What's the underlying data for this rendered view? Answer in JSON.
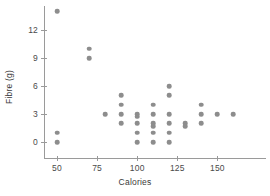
{
  "chart_data": {
    "type": "scatter",
    "title": "",
    "xlabel": "Calories",
    "ylabel": "Fibre (g)",
    "xlim": [
      40,
      170
    ],
    "ylim": [
      -0.6,
      15
    ],
    "grid": false,
    "legend": null,
    "xticks": [
      50,
      75,
      100,
      125,
      150
    ],
    "xticklabels": [
      "50",
      "75",
      "100",
      "125",
      "150"
    ],
    "yticks": [
      0,
      3,
      6,
      9,
      12
    ],
    "yticklabels": [
      "0",
      "3",
      "6",
      "9",
      "12"
    ],
    "marker_color": "#8d8d8d",
    "axis_color": "#9a9a9a",
    "background": "#ffffff",
    "points": [
      {
        "x": 50,
        "y": 14.0
      },
      {
        "x": 50,
        "y": 1.0
      },
      {
        "x": 50,
        "y": 0.0
      },
      {
        "x": 70,
        "y": 10.0
      },
      {
        "x": 70,
        "y": 9.0
      },
      {
        "x": 80,
        "y": 3.0
      },
      {
        "x": 90,
        "y": 5.0
      },
      {
        "x": 90,
        "y": 4.0
      },
      {
        "x": 90,
        "y": 3.0
      },
      {
        "x": 90,
        "y": 2.0
      },
      {
        "x": 100,
        "y": 3.0
      },
      {
        "x": 100,
        "y": 2.7
      },
      {
        "x": 100,
        "y": 2.0
      },
      {
        "x": 100,
        "y": 1.0
      },
      {
        "x": 100,
        "y": 0.0
      },
      {
        "x": 110,
        "y": 4.0
      },
      {
        "x": 110,
        "y": 3.0
      },
      {
        "x": 110,
        "y": 2.0
      },
      {
        "x": 110,
        "y": 1.7
      },
      {
        "x": 110,
        "y": 1.0
      },
      {
        "x": 110,
        "y": 0.0
      },
      {
        "x": 120,
        "y": 6.0
      },
      {
        "x": 120,
        "y": 5.0
      },
      {
        "x": 120,
        "y": 3.0
      },
      {
        "x": 120,
        "y": 2.0
      },
      {
        "x": 120,
        "y": 1.0
      },
      {
        "x": 120,
        "y": 0.0
      },
      {
        "x": 130,
        "y": 2.0
      },
      {
        "x": 130,
        "y": 1.7
      },
      {
        "x": 140,
        "y": 4.0
      },
      {
        "x": 140,
        "y": 3.0
      },
      {
        "x": 140,
        "y": 2.0
      },
      {
        "x": 150,
        "y": 3.0
      },
      {
        "x": 160,
        "y": 3.0
      }
    ]
  }
}
